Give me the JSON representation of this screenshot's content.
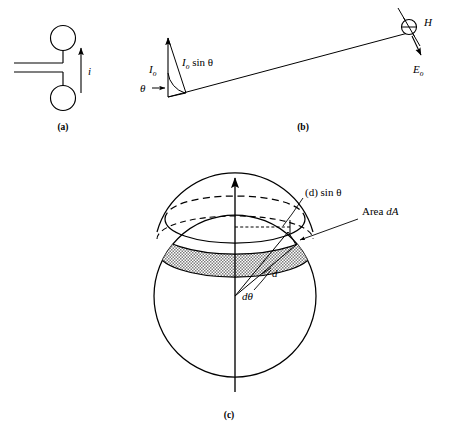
{
  "figure": {
    "background_color": "#ffffff",
    "stroke_color": "#000000",
    "shade_color": "#9a9a9a"
  },
  "panels": [
    {
      "id": "a",
      "caption": "(a)",
      "description": "Short dipole antenna fed by a two-wire transmission line",
      "labels": [
        {
          "name": "current-label",
          "text": "i"
        }
      ]
    },
    {
      "id": "b",
      "caption": "(b)",
      "description": "Current element projection and far field vectors",
      "labels": [
        {
          "name": "current-amplitude-label",
          "base": "I",
          "sub": "o"
        },
        {
          "name": "current-projection-label",
          "base": "I",
          "sub": "o",
          "suffix": " sin θ"
        },
        {
          "name": "theta-label",
          "text": "θ"
        },
        {
          "name": "magnetic-field-label",
          "base": "H",
          "sub": ""
        },
        {
          "name": "electric-field-label",
          "base": "E",
          "sub": "o"
        }
      ]
    },
    {
      "id": "c",
      "caption": "(c)",
      "description": "Sphere of radius d showing annular area element dA",
      "labels": [
        {
          "name": "radius-projection-label",
          "text": "(d) sin θ"
        },
        {
          "name": "area-label",
          "text": "Area dA"
        },
        {
          "name": "distance-label",
          "text": "d"
        },
        {
          "name": "dtheta-label",
          "text": "dθ"
        }
      ]
    }
  ],
  "panel_a": {
    "caption": "(a)",
    "current_label": "i"
  },
  "panel_b": {
    "caption": "(b)",
    "io_base": "I",
    "io_sub": "o",
    "io_sin_base": "I",
    "io_sin_sub": "o",
    "io_sin_rest": " sin θ",
    "theta": "θ",
    "h_label": "H",
    "e_base": "E",
    "e_sub": "o"
  },
  "panel_c": {
    "caption": "(c)",
    "d_sin_theta": "(d) sin θ",
    "area_da_prefix": "Area ",
    "area_da_symbol": "dA",
    "d_label": "d",
    "dtheta_label": "dθ"
  }
}
